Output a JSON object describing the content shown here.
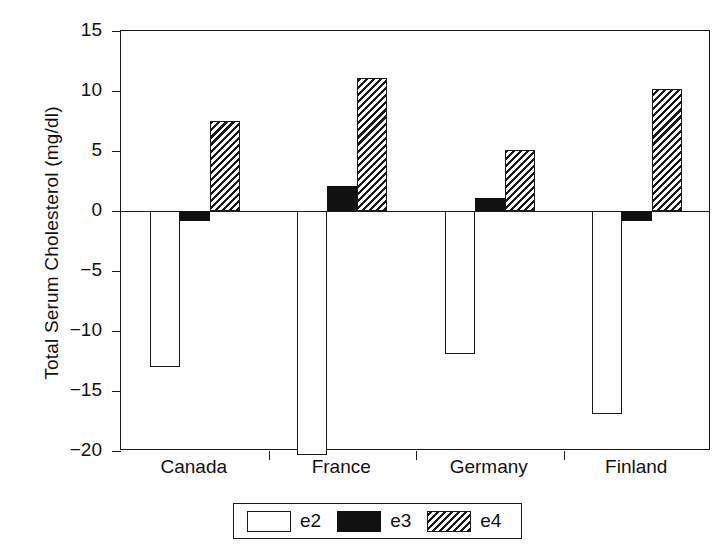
{
  "chart_data": {
    "type": "bar",
    "title": "",
    "xlabel": "",
    "ylabel": "Total Serum Cholesterol (mg/dl)",
    "categories": [
      "Canada",
      "France",
      "Germany",
      "Finland"
    ],
    "series": [
      {
        "name": "e2",
        "values": [
          -13.0,
          -22.0,
          -11.9,
          -16.9
        ]
      },
      {
        "name": "e3",
        "values": [
          -0.8,
          2.1,
          1.1,
          -0.8
        ]
      },
      {
        "name": "e4",
        "values": [
          7.5,
          11.1,
          5.1,
          10.2
        ]
      }
    ],
    "ylim": [
      -20,
      15
    ],
    "yticks": [
      15,
      10,
      5,
      0,
      -5,
      -10,
      -15,
      -20
    ],
    "ytick_labels": [
      "15",
      "10",
      "5",
      "0",
      "−5",
      "−10",
      "−15",
      "−20"
    ],
    "grid": false,
    "legend_position": "bottom"
  },
  "legend": {
    "items": [
      {
        "label": "e2",
        "swatch": "white-open-box",
        "fill": "#ffffff"
      },
      {
        "label": "e3",
        "swatch": "solid-black-box",
        "fill": "#111111"
      },
      {
        "label": "e4",
        "swatch": "diagonal-hatched-box",
        "fill": "#1a1a1a"
      }
    ]
  },
  "colors": {
    "axis": "#1a1a1a",
    "e2": "#ffffff",
    "e3": "#111111",
    "e4": "#1a1a1a",
    "background": "#ffffff"
  }
}
